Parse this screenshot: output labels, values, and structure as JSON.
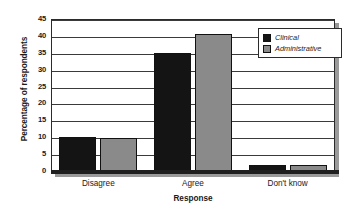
{
  "chart_data": {
    "type": "bar",
    "title": "",
    "xlabel": "Response",
    "ylabel": "Percentage of respondents",
    "categories": [
      "Disagree",
      "Agree",
      "Don't know"
    ],
    "series": [
      {
        "name": "Clinical",
        "color": "#141414",
        "values": [
          10,
          34.8,
          1.8
        ]
      },
      {
        "name": "Administrative",
        "color": "#8a8a8a",
        "values": [
          9.9,
          40.5,
          1.7
        ]
      }
    ],
    "ylim": [
      0,
      45
    ],
    "ytick_step": 5,
    "yticks": [
      "0",
      "5",
      "10",
      "15",
      "20",
      "25",
      "30",
      "35",
      "40",
      "45"
    ],
    "grid": true,
    "legend_position": "top-right-inside"
  },
  "legend": {
    "entries": [
      {
        "label": "Clinical"
      },
      {
        "label": "Administrative"
      }
    ]
  }
}
